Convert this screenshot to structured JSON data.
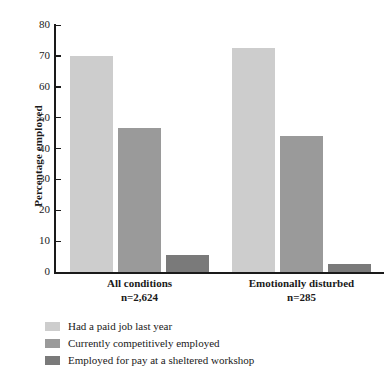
{
  "chart_data": {
    "type": "bar",
    "title": "",
    "xlabel": "",
    "ylabel": "Percentage employed",
    "ylim": [
      0,
      80
    ],
    "yticks": [
      0,
      10,
      20,
      30,
      40,
      50,
      60,
      70,
      80
    ],
    "grid": false,
    "legend_position": "bottom-left",
    "categories": [
      "All conditions",
      "Emotionally disturbed"
    ],
    "category_sublabels": [
      "n=2,624",
      "n=285"
    ],
    "series": [
      {
        "name": "Had a paid job last year",
        "color": "#cdcdcd",
        "values": [
          70,
          72.5
        ]
      },
      {
        "name": "Currently competitively employed",
        "color": "#9a9a9a",
        "values": [
          46.5,
          44
        ]
      },
      {
        "name": "Employed for pay at a sheltered workshop",
        "color": "#7a7a7a",
        "values": [
          5.5,
          2.5
        ]
      }
    ]
  },
  "axis": {
    "tick_labels": [
      "0",
      "10",
      "20",
      "30",
      "40",
      "50",
      "60",
      "70",
      "80"
    ],
    "y_title": "Percentage employed"
  },
  "categories": [
    {
      "label": "All conditions",
      "n": "n=2,624"
    },
    {
      "label": "Emotionally disturbed",
      "n": "n=285"
    }
  ],
  "legend": {
    "items": [
      {
        "label": "Had a paid job last year",
        "color": "#cdcdcd"
      },
      {
        "label": "Currently competitively employed",
        "color": "#9a9a9a"
      },
      {
        "label": "Employed for pay at a sheltered workshop",
        "color": "#7a7a7a"
      }
    ]
  }
}
